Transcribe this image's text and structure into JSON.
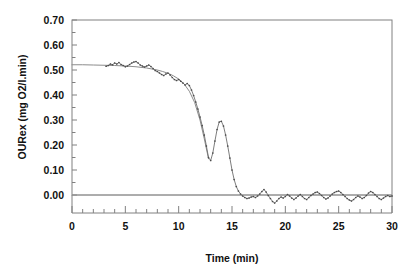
{
  "chart_data": {
    "type": "line",
    "title": "",
    "subtitle": "",
    "xlabel": "Time (min)",
    "ylabel": "OURex (mg O2/l.min)",
    "xlim": [
      0,
      30
    ],
    "ylim": [
      0.0,
      0.7
    ],
    "xticks": [
      0,
      5,
      10,
      15,
      20,
      25,
      30
    ],
    "xtick_labels": [
      "0",
      "5",
      "10",
      "15",
      "20",
      "25",
      "30"
    ],
    "yticks": [
      0.0,
      0.1,
      0.2,
      0.3,
      0.4,
      0.5,
      0.6,
      0.7
    ],
    "ytick_labels": [
      "0.00",
      "0.10",
      "0.20",
      "0.30",
      "0.40",
      "0.50",
      "0.60",
      "0.70"
    ],
    "x_minor_tick_interval": 1,
    "y_minor_tick_interval": 0.05,
    "grid": false,
    "legend": null,
    "legend_position": "none",
    "zero_reference_line": 0.0,
    "annotations": [],
    "series": [
      {
        "name": "model",
        "style": "solid-line",
        "color": "#8c8c8c",
        "marker": "none",
        "x": [
          0.0,
          1.0,
          2.0,
          3.0,
          4.0,
          5.0,
          6.0,
          7.0,
          8.0,
          8.5,
          9.0,
          9.5,
          10.0,
          10.5,
          11.0,
          11.5,
          12.0,
          12.4,
          12.8
        ],
        "values": [
          0.521,
          0.521,
          0.52,
          0.519,
          0.518,
          0.516,
          0.513,
          0.508,
          0.5,
          0.494,
          0.487,
          0.477,
          0.464,
          0.445,
          0.415,
          0.37,
          0.3,
          0.225,
          0.145
        ]
      },
      {
        "name": "measured",
        "style": "dotted-line-with-markers",
        "color": "#6e6e6e",
        "marker": "small-dot",
        "x": [
          3.2,
          3.4,
          3.6,
          3.8,
          4.0,
          4.2,
          4.4,
          4.6,
          4.8,
          5.0,
          5.2,
          5.4,
          5.6,
          5.8,
          6.0,
          6.2,
          6.4,
          6.6,
          6.8,
          7.0,
          7.2,
          7.4,
          7.6,
          7.8,
          8.0,
          8.2,
          8.4,
          8.6,
          8.8,
          9.0,
          9.2,
          9.4,
          9.6,
          9.8,
          10.0,
          10.2,
          10.4,
          10.6,
          10.8,
          11.0,
          11.2,
          11.4,
          11.6,
          11.8,
          12.0,
          12.2,
          12.4,
          12.6,
          12.8,
          13.0,
          13.2,
          13.4,
          13.6,
          13.8,
          14.0,
          14.2,
          14.4,
          14.6,
          14.8,
          15.0,
          15.2,
          15.4,
          15.6,
          15.8,
          16.0,
          16.2,
          16.4,
          16.6,
          16.8,
          17.0,
          17.2,
          17.4,
          17.6,
          17.8,
          18.0,
          18.2,
          18.4,
          18.6,
          18.8,
          19.0,
          19.2,
          19.4,
          19.6,
          19.8,
          20.0,
          20.2,
          20.4,
          20.6,
          20.8,
          21.0,
          21.2,
          21.4,
          21.6,
          21.8,
          22.0,
          22.2,
          22.4,
          22.6,
          22.8,
          23.0,
          23.2,
          23.4,
          23.6,
          23.8,
          24.0,
          24.2,
          24.4,
          24.6,
          24.8,
          25.0,
          25.2,
          25.4,
          25.6,
          25.8,
          26.0,
          26.2,
          26.4,
          26.6,
          26.8,
          27.0,
          27.2,
          27.4,
          27.6,
          27.8,
          28.0,
          28.2,
          28.4,
          28.6,
          28.8,
          29.0,
          29.2,
          29.4,
          29.6,
          29.8,
          30.0
        ],
        "values": [
          0.515,
          0.518,
          0.524,
          0.521,
          0.528,
          0.524,
          0.53,
          0.522,
          0.518,
          0.513,
          0.516,
          0.522,
          0.528,
          0.532,
          0.534,
          0.528,
          0.52,
          0.516,
          0.512,
          0.516,
          0.52,
          0.514,
          0.506,
          0.498,
          0.494,
          0.488,
          0.482,
          0.478,
          0.484,
          0.488,
          0.48,
          0.47,
          0.462,
          0.458,
          0.462,
          0.455,
          0.448,
          0.44,
          0.446,
          0.438,
          0.42,
          0.398,
          0.372,
          0.344,
          0.312,
          0.278,
          0.24,
          0.196,
          0.15,
          0.138,
          0.168,
          0.216,
          0.262,
          0.292,
          0.295,
          0.276,
          0.24,
          0.196,
          0.148,
          0.1,
          0.062,
          0.034,
          0.016,
          0.004,
          -0.004,
          -0.01,
          -0.014,
          -0.012,
          -0.008,
          -0.006,
          -0.01,
          -0.004,
          0.004,
          0.014,
          0.022,
          0.012,
          -0.002,
          -0.014,
          -0.026,
          -0.032,
          -0.024,
          -0.014,
          -0.008,
          -0.012,
          -0.006,
          0.002,
          -0.004,
          -0.012,
          -0.018,
          -0.012,
          -0.004,
          0.002,
          -0.006,
          -0.014,
          -0.018,
          -0.01,
          -0.002,
          0.004,
          0.01,
          0.012,
          0.006,
          -0.002,
          -0.01,
          -0.016,
          -0.012,
          -0.004,
          0.004,
          0.01,
          0.014,
          0.016,
          0.01,
          0.002,
          -0.006,
          -0.014,
          -0.02,
          -0.024,
          -0.018,
          -0.01,
          -0.004,
          -0.008,
          -0.014,
          -0.01,
          -0.002,
          0.008,
          0.014,
          0.01,
          0.002,
          -0.006,
          -0.014,
          -0.018,
          -0.012,
          -0.006,
          -0.002,
          -0.006,
          -0.004
        ]
      }
    ]
  }
}
